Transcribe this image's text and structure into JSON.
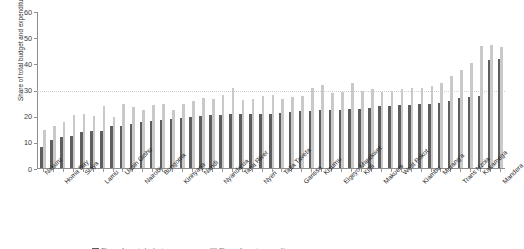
{
  "chart_data": {
    "type": "bar",
    "title": "",
    "subtitle": "",
    "xlabel": "",
    "ylabel": "Share of total budget and expenditure (%)",
    "ylim": [
      0,
      60
    ],
    "yticks": [
      0,
      10,
      20,
      30,
      40,
      50,
      60
    ],
    "grid": "dotted horizontal reference line at 30",
    "reference_line": 30,
    "legend_position": "bottom",
    "orientation": "vertical",
    "grouping": "grouped",
    "categories": [
      "Nakuru",
      "Kisii",
      "Homa Bay",
      "Migori",
      "Siaya",
      "Bomet",
      "Lamu",
      "Kericho",
      "Uasin Gishu",
      "Machakos",
      "Nairobi",
      "Kitui",
      "Bungoma",
      "Embu",
      "Kirinyaga",
      "Laikipia",
      "Nandi",
      "Baringo",
      "Nyandarua",
      "Busia",
      "Tana River",
      "Vihiga",
      "Nyeri",
      "Isiolo",
      "Taita Taveta",
      "Kwale",
      "Garissa",
      "Samburu",
      "Kisumu",
      "Narok",
      "Elgeyo Marakwet",
      "Meru",
      "Kilifi",
      "Marsabit",
      "Makueni",
      "Nyamira",
      "West Pokot",
      "Turkana",
      "Kiambu",
      "Wajir",
      "Murang'a",
      "Mombasa",
      "Trans Nzoia",
      "Tharaka Nithi",
      "Kakamega",
      "Mandera",
      "Mandera"
    ],
    "labelled_categories": [
      "Nakuru",
      "Homa Bay",
      "Siaya",
      "Lamu",
      "Uasin Gishu",
      "Nairobi",
      "Bungoma",
      "Kirinyaga",
      "Nandi",
      "Nyandarua",
      "Tana River",
      "Nyeri",
      "Taita Taveta",
      "Garissa",
      "Kisumu",
      "Elgeyo Marakwet",
      "Kilifi",
      "Makueni",
      "West Pokot",
      "Kiambu",
      "Murang'a",
      "Trans Nzoia",
      "Kakamega",
      "Mandera"
    ],
    "series": [
      {
        "name": "Share of total budget",
        "color": "#5e5e5e",
        "values": [
          8.0,
          10.7,
          11.8,
          12.4,
          13.6,
          14.0,
          14.1,
          15.9,
          16.2,
          16.7,
          17.5,
          18.0,
          18.2,
          18.8,
          19.0,
          19.5,
          20.0,
          20.2,
          20.4,
          20.5,
          20.5,
          20.5,
          20.6,
          20.7,
          20.9,
          21.3,
          21.6,
          21.8,
          22.0,
          22.1,
          22.2,
          22.4,
          22.5,
          23.0,
          23.6,
          23.8,
          24.1,
          24.2,
          24.4,
          24.6,
          25.0,
          25.7,
          26.9,
          27.3,
          27.5,
          41.2,
          41.8
        ]
      },
      {
        "name": "Share of total expenditure",
        "color": "#c9c9c9",
        "values": [
          14.5,
          16.2,
          17.4,
          20.4,
          20.8,
          19.8,
          23.6,
          19.5,
          24.4,
          23.3,
          22.2,
          24.0,
          24.6,
          22.3,
          24.4,
          25.8,
          26.6,
          26.3,
          27.8,
          30.5,
          26.0,
          26.3,
          27.5,
          28.0,
          26.4,
          27.3,
          27.6,
          30.4,
          31.6,
          28.5,
          28.9,
          32.6,
          29.5,
          30.1,
          29.1,
          29.4,
          30.2,
          30.4,
          30.7,
          31.2,
          32.3,
          35.0,
          37.5,
          40.0,
          46.5,
          47.2,
          46.3
        ]
      }
    ]
  },
  "axis": {
    "y_title": "Share of total budget and expenditure (%)",
    "y_tick_labels": [
      "0",
      "10",
      "20",
      "30",
      "40",
      "50",
      "60"
    ]
  },
  "legend": {
    "items": [
      {
        "label": "Share of county budget",
        "color": "#5e5e5e"
      },
      {
        "label": "Share of county expenditure",
        "color": "#c9c9c9"
      }
    ]
  }
}
